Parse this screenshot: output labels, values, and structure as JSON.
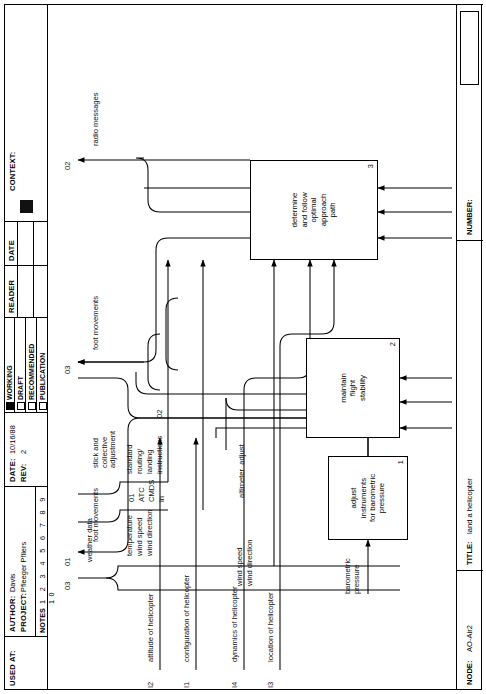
{
  "title_block": {
    "used_at_label": "USED AT:",
    "author_label": "AUTHOR:",
    "author_value": "Davis",
    "project_label": "PROJECT:",
    "project_value": "Pfleeger Pfliers",
    "date_label": "DATE:",
    "date_value": "10/16/88",
    "rev_label": "REV:",
    "rev_value": "2",
    "notes_label": "NOTES",
    "notes_numbers": "1 2 3 4 5 6 7 8 9 10",
    "status": [
      {
        "label": "WORKING",
        "checked": true
      },
      {
        "label": "DRAFT",
        "checked": false
      },
      {
        "label": "RECOMMENDED",
        "checked": false
      },
      {
        "label": "PUBLICATION",
        "checked": false
      }
    ],
    "reader_label": "READER",
    "date2_label": "DATE",
    "context_label": "CONTEXT:"
  },
  "bottom_block": {
    "node_label": "NODE:",
    "node_value": "AO-Air2",
    "title_label": "TITLE:",
    "title_value": "land a helicopter",
    "number_label": "NUMBER:"
  },
  "activities": [
    {
      "id": "A1",
      "name": "adjust\ninstruments\nfor barometric\npressure",
      "number": "1"
    },
    {
      "id": "A2",
      "name": "maintain\nflight\nstability",
      "number": "2"
    },
    {
      "id": "A3",
      "name": "determine\nand follow\noptimal\napproach\npath",
      "number": "3"
    }
  ],
  "inputs": [
    {
      "code": "I1",
      "label": "configuration of helicopter"
    },
    {
      "code": "I2",
      "label": "attitude of helicopter"
    },
    {
      "code": "I3",
      "label": "location of helicopter"
    },
    {
      "code": "I4",
      "label": "dynamics of helicopter"
    }
  ],
  "controls": [
    {
      "code": "C3",
      "label": "weather data"
    },
    {
      "code": "C1",
      "label": "ATC CMDS in"
    },
    {
      "code": "C2",
      "label": "standard routing/ landing instructions"
    }
  ],
  "outputs": [
    {
      "code": "O1",
      "label": "foot movements"
    },
    {
      "code": "O2",
      "label": "radio messages"
    },
    {
      "code": "O3",
      "label": "foot movements"
    }
  ],
  "arrow_labels": {
    "weather_data": "weather data",
    "temperature": "temperature",
    "wind_speed_top": "wind speed",
    "wind_direction_top": "wind direction",
    "c1_code": "01",
    "atc": "ATC",
    "cmds": "CMDS",
    "in": "in",
    "standard": "standard",
    "routing": "routing/",
    "landing": "landing",
    "instructions": "instructions",
    "c2_code": "02",
    "c3_code": "03",
    "wind_speed_mid": "wind speed",
    "wind_direction_mid": "wind direction",
    "altimeter_adjust": "altimeter  adjust",
    "barometric_pressure": "barometric\npressure",
    "stick_collective": "stick and\ncollective\nadjustment",
    "foot_movements_1": "foot movements",
    "foot_movements_3": "foot movements",
    "radio_messages": "radio messages",
    "o1_code": "01",
    "o2_code": "02",
    "o3_code": "03",
    "i1_code": "I1",
    "i2_code": "I2",
    "i3_code": "I3",
    "i4_code": "I4",
    "attitude": "attitude of helicopter",
    "configuration": "configuration of helicopter",
    "dynamics": "dynamics of helicopter",
    "location": "location of helicopter"
  }
}
